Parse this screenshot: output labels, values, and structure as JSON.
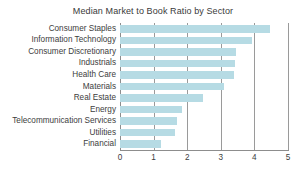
{
  "chart_data": {
    "type": "bar",
    "orientation": "horizontal",
    "title": "Median Market to Book Ratio by Sector",
    "xlabel": "",
    "ylabel": "",
    "xlim": [
      0,
      5
    ],
    "xticks": [
      "0",
      "1",
      "2",
      "3",
      "4",
      "5"
    ],
    "grid": true,
    "grid_axis": "x",
    "legend": false,
    "bar_color": "#b6dbe4",
    "categories": [
      "Consumer Staples",
      "Information Technology",
      "Consumer Discretionary",
      "Industrials",
      "Health Care",
      "Materials",
      "Real Estate",
      "Energy",
      "Telecommunication Services",
      "Utilities",
      "Financial"
    ],
    "values": [
      4.45,
      3.93,
      3.44,
      3.42,
      3.4,
      3.1,
      2.47,
      1.85,
      1.7,
      1.65,
      1.22
    ]
  }
}
